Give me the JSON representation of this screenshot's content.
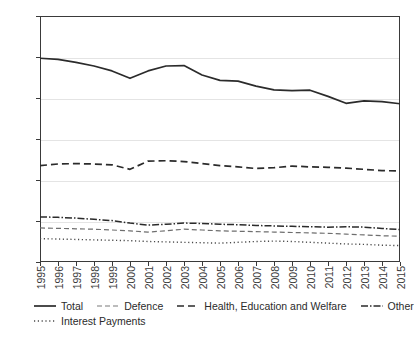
{
  "chart_data": {
    "type": "line",
    "title": "",
    "xlabel": "",
    "ylabel": "",
    "xlim": [
      1995,
      2015
    ],
    "ylim": [
      0,
      60
    ],
    "ytick_labels": [
      "0%",
      "10%",
      "20%",
      "30%",
      "40%",
      "50%",
      "60%"
    ],
    "ytick_values": [
      0,
      10,
      20,
      30,
      40,
      50,
      60
    ],
    "grid": true,
    "legend_position": "bottom",
    "x": [
      1995,
      1996,
      1997,
      1998,
      1999,
      2000,
      2001,
      2002,
      2003,
      2004,
      2005,
      2006,
      2007,
      2008,
      2009,
      2010,
      2011,
      2012,
      2013,
      2014,
      2015
    ],
    "xtick_labels": [
      "1995",
      "1996",
      "1997",
      "1998",
      "1999",
      "2000",
      "2001",
      "2002",
      "2003",
      "2004",
      "2005",
      "2006",
      "2007",
      "2008",
      "2009",
      "2010",
      "2011",
      "2012",
      "2013",
      "2014",
      "2015"
    ],
    "series": [
      {
        "name": "Total",
        "style": "solid",
        "color": "#2b2b2b",
        "values": [
          49.7,
          49.4,
          48.7,
          47.8,
          46.6,
          44.8,
          46.6,
          47.8,
          47.9,
          45.6,
          44.3,
          44.1,
          42.9,
          42.0,
          41.8,
          41.9,
          40.4,
          38.7,
          39.3,
          39.1,
          38.6
        ]
      },
      {
        "name": "Defence",
        "style": "dashed-light",
        "color": "#6e6e6e",
        "values": [
          8.3,
          8.2,
          8.1,
          8.0,
          7.8,
          7.6,
          7.3,
          7.6,
          8.0,
          7.8,
          7.6,
          7.5,
          7.4,
          7.3,
          7.2,
          7.1,
          7.0,
          6.8,
          6.6,
          6.4,
          6.3
        ]
      },
      {
        "name": "Health, Education and Welfare",
        "style": "dashed",
        "color": "#2b2b2b",
        "values": [
          23.5,
          23.9,
          24.0,
          23.9,
          23.7,
          22.6,
          24.6,
          24.7,
          24.5,
          24.0,
          23.5,
          23.2,
          22.8,
          23.0,
          23.4,
          23.2,
          23.1,
          22.9,
          22.6,
          22.3,
          22.2
        ]
      },
      {
        "name": "Other",
        "style": "dash-dot",
        "color": "#2b2b2b",
        "values": [
          11.0,
          10.9,
          10.7,
          10.4,
          10.1,
          9.5,
          9.0,
          9.2,
          9.5,
          9.4,
          9.2,
          9.1,
          8.9,
          8.8,
          8.7,
          8.6,
          8.5,
          8.6,
          8.5,
          8.2,
          7.9
        ]
      },
      {
        "name": "Interest Payments",
        "style": "dotted",
        "color": "#4a4a4a",
        "values": [
          5.7,
          5.6,
          5.5,
          5.4,
          5.3,
          5.2,
          5.0,
          4.9,
          4.8,
          4.7,
          4.6,
          4.8,
          5.0,
          5.1,
          5.0,
          4.8,
          4.6,
          4.4,
          4.3,
          4.1,
          4.0
        ]
      }
    ]
  },
  "legend": {
    "items": [
      {
        "label": "Total",
        "style": "solid"
      },
      {
        "label": "Defence",
        "style": "dashed-light"
      },
      {
        "label": "Health, Education and Welfare",
        "style": "dashed"
      },
      {
        "label": "Other",
        "style": "dash-dot"
      },
      {
        "label": "Interest Payments",
        "style": "dotted"
      }
    ]
  }
}
